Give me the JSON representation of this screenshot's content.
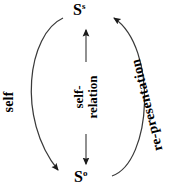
{
  "diagram": {
    "background_color": "#ffffff",
    "stroke_color": "#1a1a1a",
    "nodes": [
      {
        "id": "node-top",
        "base": "S",
        "superscript": "s"
      },
      {
        "id": "node-bottom",
        "base": "S",
        "superscript": "o"
      }
    ],
    "labels": {
      "left_arc": "self",
      "right_arc": "re-presentation",
      "center_line1": "self-",
      "center_line2": "relation"
    },
    "arrows": {
      "center_up": "arrow-up",
      "center_down": "arrow-down",
      "left_arc": "arc-arrow-down-right",
      "right_arc": "arc-arrow-up-left"
    }
  }
}
